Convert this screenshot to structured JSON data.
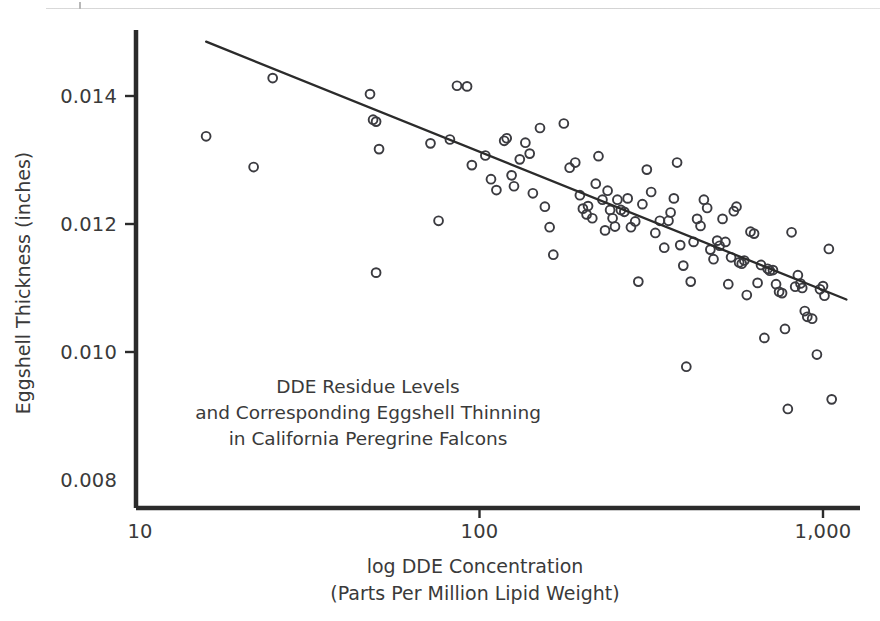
{
  "figure": {
    "background_color": "#ffffff",
    "ink_color": "#2b2b2b",
    "marker_color": "#3b3b40"
  },
  "chart_data": {
    "type": "scatter",
    "title": "",
    "annotation_lines": [
      "DDE Residue Levels",
      "and Corresponding Eggshell Thinning",
      "in California Peregrine Falcons"
    ],
    "xlabel_lines": [
      "log DDE Concentration",
      "(Parts Per Million Lipid Weight)"
    ],
    "ylabel": "Eggshell Thickness (inches)",
    "xscale": "log",
    "yscale": "linear",
    "xlim": [
      10,
      1200
    ],
    "ylim": [
      0.008,
      0.0152
    ],
    "xticks": [
      10,
      100,
      1000
    ],
    "xtick_labels": [
      "10",
      "100",
      "1,000"
    ],
    "yticks": [
      0.008,
      0.01,
      0.012,
      0.014
    ],
    "ytick_labels": [
      "0.008",
      "0.010",
      "0.012",
      "0.014"
    ],
    "grid": false,
    "legend": "none",
    "trendline": {
      "label": "least-squares regression line",
      "x_start": 16,
      "y_start": 0.01485,
      "x_end": 1170,
      "y_end": 0.01082
    },
    "series": [
      {
        "name": "Peregrine falcon eggs",
        "marker": "open-circle",
        "points": [
          [
            16,
            0.01337
          ],
          [
            22,
            0.01289
          ],
          [
            25,
            0.01428
          ],
          [
            48,
            0.01403
          ],
          [
            49,
            0.01363
          ],
          [
            50,
            0.0136
          ],
          [
            51,
            0.01317
          ],
          [
            50,
            0.01124
          ],
          [
            72,
            0.01326
          ],
          [
            76,
            0.01205
          ],
          [
            82,
            0.01332
          ],
          [
            86,
            0.01416
          ],
          [
            92,
            0.01415
          ],
          [
            95,
            0.01292
          ],
          [
            104,
            0.01307
          ],
          [
            108,
            0.0127
          ],
          [
            112,
            0.01253
          ],
          [
            118,
            0.0133
          ],
          [
            120,
            0.01334
          ],
          [
            124,
            0.01276
          ],
          [
            126,
            0.01259
          ],
          [
            131,
            0.01301
          ],
          [
            136,
            0.01327
          ],
          [
            140,
            0.0131
          ],
          [
            143,
            0.01248
          ],
          [
            150,
            0.0135
          ],
          [
            155,
            0.01227
          ],
          [
            160,
            0.01195
          ],
          [
            164,
            0.01152
          ],
          [
            176,
            0.01357
          ],
          [
            183,
            0.01288
          ],
          [
            190,
            0.01296
          ],
          [
            196,
            0.01245
          ],
          [
            200,
            0.01224
          ],
          [
            205,
            0.01215
          ],
          [
            207,
            0.01228
          ],
          [
            213,
            0.01209
          ],
          [
            218,
            0.01263
          ],
          [
            222,
            0.01306
          ],
          [
            228,
            0.01238
          ],
          [
            232,
            0.0119
          ],
          [
            236,
            0.01252
          ],
          [
            240,
            0.01222
          ],
          [
            244,
            0.01209
          ],
          [
            248,
            0.01196
          ],
          [
            252,
            0.01238
          ],
          [
            258,
            0.01222
          ],
          [
            264,
            0.01219
          ],
          [
            270,
            0.0124
          ],
          [
            276,
            0.01195
          ],
          [
            284,
            0.01204
          ],
          [
            290,
            0.0111
          ],
          [
            298,
            0.01231
          ],
          [
            307,
            0.01285
          ],
          [
            316,
            0.0125
          ],
          [
            325,
            0.01186
          ],
          [
            335,
            0.01205
          ],
          [
            345,
            0.01163
          ],
          [
            355,
            0.01205
          ],
          [
            360,
            0.01218
          ],
          [
            368,
            0.0124
          ],
          [
            376,
            0.01296
          ],
          [
            384,
            0.01167
          ],
          [
            392,
            0.01135
          ],
          [
            400,
            0.00977
          ],
          [
            412,
            0.0111
          ],
          [
            420,
            0.01172
          ],
          [
            430,
            0.01208
          ],
          [
            440,
            0.01197
          ],
          [
            450,
            0.01238
          ],
          [
            460,
            0.01225
          ],
          [
            470,
            0.0116
          ],
          [
            480,
            0.01145
          ],
          [
            492,
            0.01174
          ],
          [
            500,
            0.01166
          ],
          [
            510,
            0.01208
          ],
          [
            520,
            0.01172
          ],
          [
            530,
            0.01106
          ],
          [
            540,
            0.01148
          ],
          [
            550,
            0.0122
          ],
          [
            560,
            0.01227
          ],
          [
            570,
            0.0114
          ],
          [
            580,
            0.01138
          ],
          [
            590,
            0.01143
          ],
          [
            600,
            0.01089
          ],
          [
            615,
            0.01188
          ],
          [
            630,
            0.01185
          ],
          [
            645,
            0.01108
          ],
          [
            660,
            0.01136
          ],
          [
            675,
            0.01022
          ],
          [
            690,
            0.0113
          ],
          [
            700,
            0.01127
          ],
          [
            715,
            0.01128
          ],
          [
            730,
            0.01106
          ],
          [
            745,
            0.01094
          ],
          [
            760,
            0.01092
          ],
          [
            775,
            0.01036
          ],
          [
            790,
            0.00911
          ],
          [
            810,
            0.01187
          ],
          [
            830,
            0.01102
          ],
          [
            845,
            0.0112
          ],
          [
            860,
            0.01107
          ],
          [
            870,
            0.011
          ],
          [
            885,
            0.01064
          ],
          [
            900,
            0.01055
          ],
          [
            930,
            0.01052
          ],
          [
            960,
            0.00996
          ],
          [
            980,
            0.01098
          ],
          [
            1000,
            0.01103
          ],
          [
            1010,
            0.01088
          ],
          [
            1040,
            0.01161
          ],
          [
            1060,
            0.00926
          ]
        ]
      }
    ]
  }
}
